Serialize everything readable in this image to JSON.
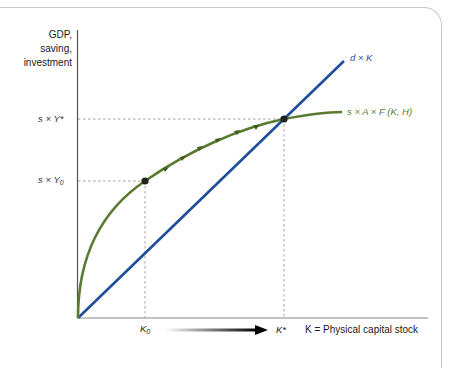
{
  "figure": {
    "y_axis_label_lines": [
      "GDP,",
      "saving,",
      "investment"
    ],
    "x_axis_label": "K = Physical capital stock",
    "y_ticks": {
      "steady_state": "s × Y*",
      "initial_base": "s × Y",
      "initial_sub": "0"
    },
    "x_ticks": {
      "initial_base": "K",
      "initial_sub": "0",
      "steady_state": "K*"
    },
    "curves": {
      "depreciation_label": "d × K",
      "saving_label": "s × A × F (K, H)"
    },
    "colors": {
      "depreciation_line": "#1f4e9c",
      "saving_curve": "#5a7a32",
      "axis": "#555555",
      "dashed_guides": "#999999",
      "frame": "#c9c9c9",
      "point": "#222222"
    }
  }
}
